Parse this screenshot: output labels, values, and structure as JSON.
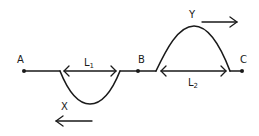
{
  "diagram": {
    "type": "wave-pulses-on-string",
    "points": {
      "A": {
        "label": "A"
      },
      "B": {
        "label": "B"
      },
      "C": {
        "label": "C"
      }
    },
    "pulses": {
      "X": {
        "label": "X",
        "shape": "trough",
        "direction": "left",
        "length_label": "L",
        "length_sub": "1"
      },
      "Y": {
        "label": "Y",
        "shape": "crest",
        "direction": "right",
        "length_label": "L",
        "length_sub": "2"
      }
    },
    "colors": {
      "ink": "#1a1a1a",
      "background": "#ffffff"
    }
  }
}
